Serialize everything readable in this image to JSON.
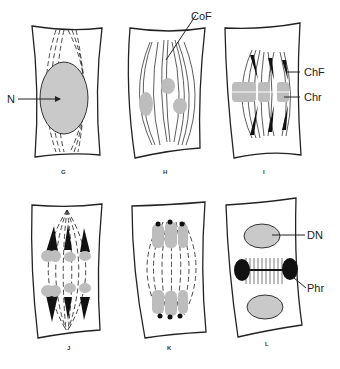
{
  "figure": {
    "panels": [
      {
        "id": "G",
        "caption": "G",
        "labels": [
          {
            "text": "N",
            "meaning": "nucleus"
          }
        ]
      },
      {
        "id": "H",
        "caption": "H",
        "labels": [
          {
            "text": "CoF"
          }
        ]
      },
      {
        "id": "I",
        "caption": "I",
        "labels": [
          {
            "text": "ChF"
          },
          {
            "text": "Chr"
          }
        ]
      },
      {
        "id": "J",
        "caption": "J",
        "labels": []
      },
      {
        "id": "K",
        "caption": "K",
        "labels": []
      },
      {
        "id": "L",
        "caption": "L",
        "labels": [
          {
            "text": "DN"
          },
          {
            "text": "Phr"
          }
        ]
      }
    ]
  },
  "colors": {
    "line": "#222222",
    "fill_gray": "#c9c9c9",
    "background": "#ffffff"
  }
}
